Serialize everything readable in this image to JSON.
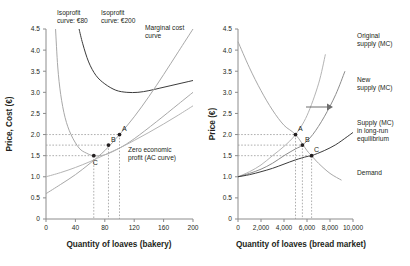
{
  "chart_data": [
    {
      "type": "line",
      "panel": "left",
      "title": "",
      "xlabel": "Quantity of loaves (bakery)",
      "ylabel": "Price, Cost (€)",
      "xlim": [
        0,
        200
      ],
      "ylim": [
        0,
        4.5
      ],
      "xticks": [
        "0",
        "40",
        "80",
        "120",
        "160",
        "200"
      ],
      "xtick_values": [
        0,
        40,
        80,
        120,
        160,
        200
      ],
      "yticks": [
        "0",
        "0.5",
        "1.0",
        "1.5",
        "2.0",
        "2.5",
        "3.0",
        "3.5",
        "4.0",
        "4.5"
      ],
      "ytick_values": [
        0,
        0.5,
        1.0,
        1.5,
        2.0,
        2.5,
        3.0,
        3.5,
        4.0,
        4.5
      ],
      "grid": false,
      "legend_position": "inline-annotations",
      "annotations": [
        {
          "name": "isoprofit-80-label",
          "text": "Isoprofit\ncurve: €80",
          "line1": "Isoprofit",
          "line2": "curve: €80"
        },
        {
          "name": "isoprofit-200-label",
          "text": "Isoprofit\ncurve: €200",
          "line1": "Isoprofit",
          "line2": "curve: €200"
        },
        {
          "name": "marginal-cost-label",
          "text": "Marginal cost\ncurve",
          "line1": "Marginal cost",
          "line2": "curve"
        },
        {
          "name": "zero-economic-profit-label",
          "text": "Zero economic\nprofit (AC curve)",
          "line1": "Zero economic",
          "line2": "profit (AC curve)"
        }
      ],
      "points": [
        {
          "label": "A",
          "x": 100,
          "y": 2.0
        },
        {
          "label": "B",
          "x": 85,
          "y": 1.75
        },
        {
          "label": "C",
          "x": 65,
          "y": 1.5
        }
      ],
      "series": [
        {
          "name": "Isoprofit curve: €80",
          "color": "#a8a8a8",
          "x": [
            13,
            16,
            20,
            26,
            34,
            45,
            55,
            65,
            80,
            100,
            120,
            150,
            180,
            200
          ],
          "values": [
            4.5,
            3.6,
            2.95,
            2.4,
            2.0,
            1.68,
            1.56,
            1.5,
            1.52,
            1.68,
            1.9,
            2.3,
            2.72,
            3.0
          ]
        },
        {
          "name": "Isoprofit curve: €200",
          "color": "#3b3b3b",
          "x": [
            45,
            50,
            58,
            68,
            80,
            95,
            110,
            125,
            140,
            155,
            170,
            185,
            200
          ],
          "values": [
            4.5,
            4.15,
            3.72,
            3.4,
            3.2,
            3.05,
            3.0,
            3.0,
            3.04,
            3.1,
            3.16,
            3.22,
            3.28
          ]
        },
        {
          "name": "Marginal cost curve",
          "color": "#a8a8a8",
          "x": [
            0,
            20,
            40,
            60,
            80,
            100,
            120,
            140,
            160,
            180,
            200
          ],
          "values": [
            0.6,
            0.82,
            1.05,
            1.32,
            1.62,
            2.0,
            2.42,
            2.9,
            3.42,
            3.96,
            4.5
          ]
        },
        {
          "name": "Zero economic profit (AC curve)",
          "color": "#b4b4b4",
          "x": [
            0,
            20,
            40,
            60,
            80,
            100,
            120,
            140,
            160,
            180,
            200
          ],
          "values": [
            1.0,
            1.1,
            1.22,
            1.36,
            1.52,
            1.68,
            1.86,
            2.05,
            2.25,
            2.46,
            2.68
          ]
        }
      ]
    },
    {
      "type": "line",
      "panel": "right",
      "title": "",
      "xlabel": "Quantity of loaves (bread market)",
      "ylabel": "Price (€)",
      "xlim": [
        0,
        10000
      ],
      "ylim": [
        0,
        4.5
      ],
      "xticks": [
        "0",
        "2,000",
        "4,000",
        "6,000",
        "8,000",
        "10,000"
      ],
      "xtick_values": [
        0,
        2000,
        4000,
        6000,
        8000,
        10000
      ],
      "yticks": [
        "0",
        "0.5",
        "1.0",
        "1.5",
        "2.0",
        "2.5",
        "3.0",
        "3.5",
        "4.0",
        "4.5"
      ],
      "ytick_values": [
        0,
        0.5,
        1.0,
        1.5,
        2.0,
        2.5,
        3.0,
        3.5,
        4.0,
        4.5
      ],
      "grid": false,
      "legend_position": "inline-annotations",
      "annotations": [
        {
          "name": "original-supply-label",
          "text": "Original\nsupply (MC)",
          "line1": "Original",
          "line2": "supply (MC)"
        },
        {
          "name": "new-supply-label",
          "text": "New\nsupply (MC)",
          "line1": "New",
          "line2": "supply (MC)"
        },
        {
          "name": "long-run-supply-label",
          "text": "Supply (MC)\nin long-run\nequilibrium",
          "line1": "Supply (MC)",
          "line2": "in long-run",
          "line3": "equilibrium"
        },
        {
          "name": "demand-label",
          "text": "Demand",
          "line1": "Demand"
        },
        {
          "name": "shift-arrow",
          "text": "→"
        }
      ],
      "points": [
        {
          "label": "A",
          "x": 5000,
          "y": 2.0
        },
        {
          "label": "B",
          "x": 5600,
          "y": 1.75
        },
        {
          "label": "C",
          "x": 6400,
          "y": 1.5
        }
      ],
      "series": [
        {
          "name": "Original supply (MC)",
          "color": "#b4b4b4",
          "x": [
            0,
            1000,
            2000,
            3000,
            4000,
            5000,
            6000,
            7000,
            7600
          ],
          "values": [
            1.0,
            1.12,
            1.28,
            1.5,
            1.72,
            2.0,
            2.45,
            3.2,
            3.9
          ]
        },
        {
          "name": "New supply (MC)",
          "color": "#8c8c8c",
          "x": [
            0,
            1000,
            2000,
            3000,
            4000,
            5000,
            5600,
            6500,
            7500,
            8500,
            9300
          ],
          "values": [
            1.0,
            1.08,
            1.18,
            1.32,
            1.5,
            1.66,
            1.75,
            2.0,
            2.42,
            2.95,
            3.5
          ]
        },
        {
          "name": "Supply (MC) in long-run equilibrium",
          "color": "#3b3b3b",
          "x": [
            0,
            1000,
            2000,
            3000,
            4000,
            5000,
            6000,
            6400,
            7500,
            8500,
            9500,
            10000
          ],
          "values": [
            1.0,
            1.05,
            1.12,
            1.2,
            1.3,
            1.4,
            1.48,
            1.5,
            1.62,
            1.76,
            1.95,
            2.05
          ]
        },
        {
          "name": "Demand",
          "color": "#a8a8a8",
          "x": [
            0,
            1000,
            2000,
            3000,
            4000,
            5000,
            6000,
            6400,
            7000,
            8000,
            9000
          ],
          "values": [
            4.2,
            3.58,
            3.04,
            2.58,
            2.22,
            2.0,
            1.62,
            1.5,
            1.32,
            1.08,
            0.92
          ]
        }
      ]
    }
  ]
}
